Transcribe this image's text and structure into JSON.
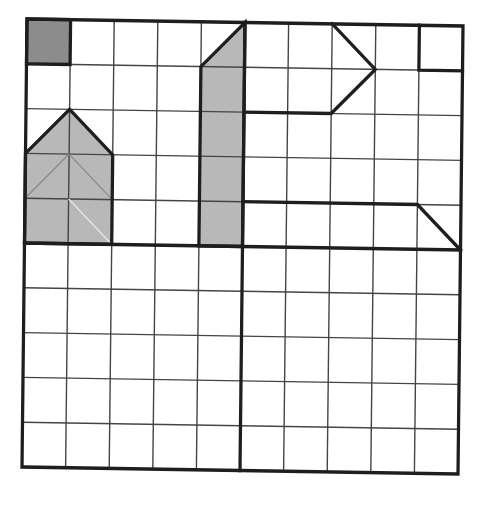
{
  "diagram": {
    "title": "",
    "grid": {
      "columns": 10,
      "rows": 10,
      "thick_dividers": {
        "vertical_at": 5,
        "horizontal_at": 5
      }
    },
    "colors": {
      "dark_fill": "#8c8c8c",
      "light_fill": "#b8b8b8",
      "line": "#1e1e1e",
      "grid_line": "#444444",
      "background": "#ffffff"
    },
    "shapes": [
      {
        "name": "dark-square",
        "fill": "dark",
        "points": [
          [
            0,
            0
          ],
          [
            1,
            0
          ],
          [
            1,
            1
          ],
          [
            0,
            1
          ]
        ]
      },
      {
        "name": "house-pentagon",
        "fill": "light",
        "points": [
          [
            0,
            3
          ],
          [
            1,
            2
          ],
          [
            2,
            3
          ],
          [
            2,
            5
          ],
          [
            0,
            5
          ]
        ]
      },
      {
        "name": "tall-column",
        "fill": "light",
        "points": [
          [
            4,
            1
          ],
          [
            5,
            0
          ],
          [
            5,
            5
          ],
          [
            4,
            5
          ]
        ]
      },
      {
        "name": "arrow-outline",
        "fill": "none",
        "points": [
          [
            5,
            2
          ],
          [
            7,
            2
          ],
          [
            8,
            1
          ],
          [
            7,
            0
          ]
        ]
      },
      {
        "name": "corner-square-outline",
        "fill": "none",
        "points": [
          [
            9,
            0
          ],
          [
            9,
            1
          ],
          [
            10,
            1
          ]
        ]
      },
      {
        "name": "trapezoid-outline",
        "fill": "none",
        "points": [
          [
            5,
            4
          ],
          [
            9,
            4
          ],
          [
            10,
            5
          ]
        ]
      }
    ],
    "inner_lines": [
      {
        "from": [
          1,
          3
        ],
        "to": [
          0,
          4
        ],
        "tone": "dark"
      },
      {
        "from": [
          1,
          3
        ],
        "to": [
          2,
          4
        ],
        "tone": "dark"
      },
      {
        "from": [
          1,
          4
        ],
        "to": [
          2,
          5
        ],
        "tone": "light"
      }
    ]
  }
}
